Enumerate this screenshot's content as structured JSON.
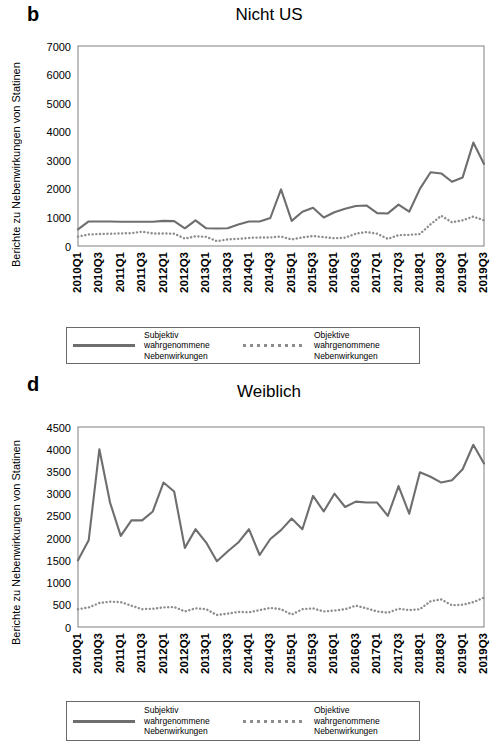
{
  "panels": [
    {
      "letter": "b",
      "title": "Nicht US",
      "ylabel": "Berichte zu Nebenwirkungen von Statinen"
    },
    {
      "letter": "d",
      "title": "Weiblich",
      "ylabel": "Berichte zu Nebenwirkungen von Statinen"
    }
  ],
  "legend": {
    "subjective_label": "Subjektiv\nwahrgenommene\nNebenwirkungen",
    "objective_label": "Objektive\nwahrgenommene\nNebenwirkungen",
    "subjective_style": "solid-line",
    "objective_style": "dotted-line"
  },
  "colors": {
    "line": "#6e6e6e",
    "dotted": "#8d8d8d",
    "axis": "#8a8a8a",
    "text": "#000000",
    "background": "#ffffff"
  },
  "chart_data": [
    {
      "type": "line",
      "panel": "b",
      "title": "Nicht US",
      "xlabel": "",
      "ylabel": "Berichte zu Nebenwirkungen von Statinen",
      "ylim": [
        0,
        7000
      ],
      "yticks": [
        0,
        1000,
        2000,
        3000,
        4000,
        5000,
        6000,
        7000
      ],
      "grid": false,
      "legend_position": "below",
      "x": [
        "2010Q1",
        "2010Q2",
        "2010Q3",
        "2010Q4",
        "2011Q1",
        "2011Q2",
        "2011Q3",
        "2011Q4",
        "2012Q1",
        "2012Q2",
        "2012Q3",
        "2012Q4",
        "2013Q1",
        "2013Q2",
        "2013Q3",
        "2013Q4",
        "2014Q1",
        "2014Q2",
        "2014Q3",
        "2014Q4",
        "2015Q1",
        "2015Q2",
        "2015Q3",
        "2015Q4",
        "2016Q1",
        "2016Q2",
        "2016Q3",
        "2016Q4",
        "2017Q1",
        "2017Q2",
        "2017Q3",
        "2017Q4",
        "2018Q1",
        "2018Q2",
        "2018Q3",
        "2018Q4",
        "2019Q1",
        "2019Q2",
        "2019Q3"
      ],
      "xtick_labels": [
        "2010Q1",
        "2010Q3",
        "2011Q1",
        "2011Q3",
        "2012Q1",
        "2012Q3",
        "2013Q1",
        "2013Q3",
        "2014Q1",
        "2014Q3",
        "2015Q1",
        "2015Q3",
        "2016Q1",
        "2016Q3",
        "2017Q1",
        "2017Q3",
        "2018Q1",
        "2018Q3",
        "2019Q1",
        "2019Q3"
      ],
      "xtick_every": 2,
      "series": [
        {
          "name": "Subjektiv wahrgenommene Nebenwirkungen",
          "style": "solid",
          "values": [
            580,
            860,
            860,
            860,
            850,
            850,
            850,
            850,
            880,
            870,
            620,
            900,
            620,
            610,
            620,
            750,
            860,
            860,
            980,
            1980,
            880,
            1200,
            1340,
            1000,
            1180,
            1300,
            1400,
            1420,
            1150,
            1140,
            1450,
            1200,
            2000,
            2580,
            2540,
            2250,
            2400,
            3620,
            2870
          ]
        },
        {
          "name": "Objektive wahrgenommene Nebenwirkungen",
          "style": "dotted",
          "values": [
            330,
            400,
            420,
            430,
            440,
            450,
            500,
            440,
            440,
            430,
            260,
            340,
            320,
            170,
            230,
            250,
            280,
            300,
            300,
            330,
            230,
            300,
            350,
            310,
            270,
            290,
            430,
            490,
            430,
            250,
            380,
            390,
            420,
            760,
            1060,
            830,
            900,
            1030,
            900
          ]
        }
      ]
    },
    {
      "type": "line",
      "panel": "d",
      "title": "Weiblich",
      "xlabel": "",
      "ylabel": "Berichte zu Nebenwirkungen von Statinen",
      "ylim": [
        0,
        4500
      ],
      "yticks": [
        0,
        500,
        1000,
        1500,
        2000,
        2500,
        3000,
        3500,
        4000,
        4500
      ],
      "grid": false,
      "legend_position": "below",
      "x": [
        "2010Q1",
        "2010Q2",
        "2010Q3",
        "2010Q4",
        "2011Q1",
        "2011Q2",
        "2011Q3",
        "2011Q4",
        "2012Q1",
        "2012Q2",
        "2012Q3",
        "2012Q4",
        "2013Q1",
        "2013Q2",
        "2013Q3",
        "2013Q4",
        "2014Q1",
        "2014Q2",
        "2014Q3",
        "2014Q4",
        "2015Q1",
        "2015Q2",
        "2015Q3",
        "2015Q4",
        "2016Q1",
        "2016Q2",
        "2016Q3",
        "2016Q4",
        "2017Q1",
        "2017Q2",
        "2017Q3",
        "2017Q4",
        "2018Q1",
        "2018Q2",
        "2018Q3",
        "2018Q4",
        "2019Q1",
        "2019Q2",
        "2019Q3"
      ],
      "xtick_labels": [
        "2010Q1",
        "2010Q3",
        "2011Q1",
        "2011Q3",
        "2012Q1",
        "2012Q3",
        "2013Q1",
        "2013Q3",
        "2014Q1",
        "2014Q3",
        "2015Q1",
        "2015Q3",
        "2016Q1",
        "2016Q3",
        "2017Q1",
        "2017Q3",
        "2018Q1",
        "2018Q3",
        "2019Q1",
        "2019Q3"
      ],
      "xtick_every": 2,
      "series": [
        {
          "name": "Subjektiv wahrgenommene Nebenwirkungen",
          "style": "solid",
          "values": [
            1500,
            1950,
            4000,
            2800,
            2050,
            2400,
            2400,
            2600,
            3250,
            3050,
            1780,
            2200,
            1900,
            1480,
            1700,
            1900,
            2200,
            1620,
            1980,
            2180,
            2440,
            2200,
            2950,
            2600,
            3000,
            2700,
            2820,
            2800,
            2800,
            2500,
            3170,
            2550,
            3480,
            3380,
            3250,
            3300,
            3550,
            4100,
            3680
          ]
        },
        {
          "name": "Objektive wahrgenommene Nebenwirkungen",
          "style": "dotted",
          "values": [
            400,
            440,
            540,
            570,
            560,
            480,
            400,
            410,
            440,
            450,
            350,
            420,
            400,
            270,
            300,
            340,
            330,
            380,
            430,
            400,
            280,
            400,
            420,
            350,
            370,
            400,
            480,
            420,
            350,
            320,
            410,
            380,
            400,
            580,
            620,
            490,
            500,
            560,
            660
          ]
        }
      ]
    }
  ]
}
